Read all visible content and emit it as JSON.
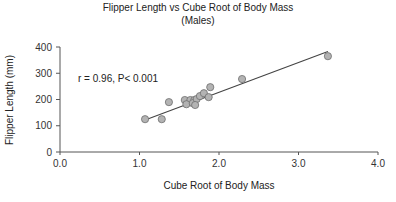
{
  "chart_data": {
    "type": "scatter",
    "title": "Flipper Length vs Cube Root of Body Mass",
    "subtitle": "(Males)",
    "xlabel": "Cube Root of Body Mass",
    "ylabel": "Flipper Length (mm)",
    "xlim": [
      0.0,
      4.0
    ],
    "ylim": [
      0,
      400
    ],
    "x_ticks": [
      "0.0",
      "1.0",
      "2.0",
      "3.0",
      "4.0"
    ],
    "y_ticks": [
      "0",
      "100",
      "200",
      "300",
      "400"
    ],
    "annotation": "r = 0.96, P< 0.001",
    "grid": false,
    "legend": null,
    "series": [
      {
        "name": "Males",
        "points": [
          {
            "x": 1.07,
            "y": 125
          },
          {
            "x": 1.28,
            "y": 125
          },
          {
            "x": 1.37,
            "y": 190
          },
          {
            "x": 1.57,
            "y": 198
          },
          {
            "x": 1.64,
            "y": 198
          },
          {
            "x": 1.69,
            "y": 198
          },
          {
            "x": 1.59,
            "y": 182
          },
          {
            "x": 1.67,
            "y": 186
          },
          {
            "x": 1.72,
            "y": 202
          },
          {
            "x": 1.7,
            "y": 179
          },
          {
            "x": 1.76,
            "y": 213
          },
          {
            "x": 1.81,
            "y": 224
          },
          {
            "x": 1.87,
            "y": 209
          },
          {
            "x": 1.89,
            "y": 247
          },
          {
            "x": 2.29,
            "y": 278
          },
          {
            "x": 3.37,
            "y": 365
          }
        ]
      }
    ],
    "fit_line": {
      "x1": 1.07,
      "y1": 122,
      "x2": 3.37,
      "y2": 383
    },
    "style": {
      "marker_fill": "#b3b3b3",
      "marker_stroke": "#6e6e6e",
      "line_color": "#444444",
      "axis_color": "#555555"
    }
  }
}
